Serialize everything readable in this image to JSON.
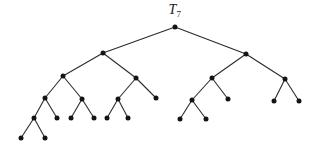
{
  "figure": {
    "background": "#ffffff",
    "label": {
      "base": "T",
      "subscript": "7"
    }
  },
  "tree": {
    "type": "binary-tree",
    "node_color": "#141414",
    "edge_color": "#2b2b2b",
    "node_radius": 2.5,
    "edge_width": 1.1,
    "nodes": [
      {
        "id": "root",
        "x": 175,
        "y": 27
      },
      {
        "id": "L",
        "x": 103,
        "y": 53
      },
      {
        "id": "R",
        "x": 246,
        "y": 54
      },
      {
        "id": "LL",
        "x": 63,
        "y": 76
      },
      {
        "id": "LR",
        "x": 136,
        "y": 78
      },
      {
        "id": "RL",
        "x": 212,
        "y": 78
      },
      {
        "id": "RR",
        "x": 285,
        "y": 79
      },
      {
        "id": "LLL",
        "x": 45,
        "y": 98
      },
      {
        "id": "LLR",
        "x": 82,
        "y": 99
      },
      {
        "id": "LRL",
        "x": 118,
        "y": 99
      },
      {
        "id": "LRR",
        "x": 156,
        "y": 98
      },
      {
        "id": "RLL",
        "x": 192,
        "y": 100
      },
      {
        "id": "RLR",
        "x": 228,
        "y": 99
      },
      {
        "id": "RRL",
        "x": 274,
        "y": 101
      },
      {
        "id": "RRR",
        "x": 299,
        "y": 101
      },
      {
        "id": "LLLL",
        "x": 34,
        "y": 118
      },
      {
        "id": "LLLR",
        "x": 57,
        "y": 118
      },
      {
        "id": "LLRa",
        "x": 71,
        "y": 118
      },
      {
        "id": "LLRb",
        "x": 94,
        "y": 118
      },
      {
        "id": "LRLa",
        "x": 107,
        "y": 118
      },
      {
        "id": "LRLb",
        "x": 128,
        "y": 118
      },
      {
        "id": "RLLa",
        "x": 180,
        "y": 119
      },
      {
        "id": "RLLb",
        "x": 206,
        "y": 119
      },
      {
        "id": "LLLLa",
        "x": 21,
        "y": 138
      },
      {
        "id": "LLLLb",
        "x": 45,
        "y": 138
      }
    ],
    "edges": [
      [
        "root",
        "L"
      ],
      [
        "root",
        "R"
      ],
      [
        "L",
        "LL"
      ],
      [
        "L",
        "LR"
      ],
      [
        "R",
        "RL"
      ],
      [
        "R",
        "RR"
      ],
      [
        "LL",
        "LLL"
      ],
      [
        "LL",
        "LLR"
      ],
      [
        "LR",
        "LRL"
      ],
      [
        "LR",
        "LRR"
      ],
      [
        "RL",
        "RLL"
      ],
      [
        "RL",
        "RLR"
      ],
      [
        "RR",
        "RRL"
      ],
      [
        "RR",
        "RRR"
      ],
      [
        "LLL",
        "LLLL"
      ],
      [
        "LLL",
        "LLLR"
      ],
      [
        "LLR",
        "LLRa"
      ],
      [
        "LLR",
        "LLRb"
      ],
      [
        "LRL",
        "LRLa"
      ],
      [
        "LRL",
        "LRLb"
      ],
      [
        "RLL",
        "RLLa"
      ],
      [
        "RLL",
        "RLLb"
      ],
      [
        "LLLL",
        "LLLLa"
      ],
      [
        "LLLL",
        "LLLLb"
      ]
    ]
  }
}
